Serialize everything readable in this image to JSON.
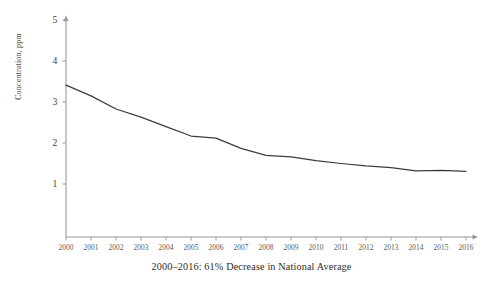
{
  "chart_data": {
    "type": "line",
    "title": "",
    "caption": "2000–2016:  61% Decrease in National Average",
    "xlabel": "",
    "ylabel": "Concentration, ppm",
    "x": [
      2000,
      2001,
      2002,
      2003,
      2004,
      2005,
      2006,
      2007,
      2008,
      2009,
      2010,
      2011,
      2012,
      2013,
      2014,
      2015,
      2016
    ],
    "categories": [
      "2000",
      "2001",
      "2002",
      "2003",
      "2004",
      "2005",
      "2006",
      "2007",
      "2008",
      "2009",
      "2010",
      "2011",
      "2012",
      "2013",
      "2014",
      "2015",
      "2016"
    ],
    "values": [
      3.41,
      3.15,
      2.83,
      2.63,
      2.4,
      2.17,
      2.12,
      1.87,
      1.7,
      1.66,
      1.57,
      1.5,
      1.44,
      1.4,
      1.32,
      1.33,
      1.31
    ],
    "series": [
      {
        "name": "National Average",
        "values": [
          3.41,
          3.15,
          2.83,
          2.63,
          2.4,
          2.17,
          2.12,
          1.87,
          1.7,
          1.66,
          1.57,
          1.5,
          1.44,
          1.4,
          1.32,
          1.33,
          1.31
        ]
      }
    ],
    "xlim": [
      2000,
      2016
    ],
    "ylim": [
      0,
      5
    ],
    "yticks": [
      1,
      2,
      3,
      4,
      5
    ],
    "ytick_labels": [
      "1",
      "2",
      "3",
      "4",
      "5"
    ],
    "grid": false,
    "legend": "none",
    "line_color": "#3c3c3c",
    "axis_color": "#9a9a9a",
    "background": "#ffffff"
  }
}
